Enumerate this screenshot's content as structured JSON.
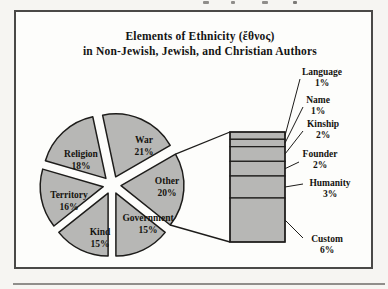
{
  "page": {
    "title_line1": "Elements of Ethnicity (ἔθνος)",
    "title_line2": "in Non-Jewish, Jewish, and Christian Authors"
  },
  "chart_data": {
    "type": "pie",
    "subtype": "bar-of-pie",
    "title": "Elements of Ethnicity (ἔθνος) in Non-Jewish, Jewish, and Christian Authors",
    "legend_position": "none",
    "slice_fill": "#b7b7b5",
    "line_color": "#1d1c1a",
    "pie": {
      "direction": "clockwise-from-top",
      "start_offset_deg": -12,
      "center": [
        112,
        185
      ],
      "radius": 63,
      "explode_px": 9,
      "slices": [
        {
          "label": "War",
          "value": 21,
          "label_xy": [
            144,
            143
          ]
        },
        {
          "label": "Other",
          "value": 20,
          "label_xy": [
            167,
            184
          ],
          "breakout": true
        },
        {
          "label": "Government",
          "value": 15,
          "label_xy": [
            148,
            221
          ]
        },
        {
          "label": "Kind",
          "value": 15,
          "label_xy": [
            100,
            235
          ]
        },
        {
          "label": "Territory",
          "value": 16,
          "label_xy": [
            69,
            198
          ]
        },
        {
          "label": "Religion",
          "value": 18,
          "label_xy": [
            81,
            157
          ]
        }
      ]
    },
    "breakout_bar": {
      "x": 230,
      "y": 132,
      "width": 55,
      "height": 110,
      "segments": [
        {
          "label": "Language",
          "value": 1,
          "label_xy": [
            322,
            75
          ],
          "leader_from": [
            300,
            79
          ]
        },
        {
          "label": "Name",
          "value": 1,
          "label_xy": [
            318,
            103
          ],
          "leader_from": [
            303,
            107
          ]
        },
        {
          "label": "Kinship",
          "value": 2,
          "label_xy": [
            323,
            127
          ],
          "leader_from": [
            303,
            131
          ]
        },
        {
          "label": "Founder",
          "value": 2,
          "label_xy": [
            320,
            157
          ],
          "leader_from": [
            299,
            162
          ]
        },
        {
          "label": "Humanity",
          "value": 3,
          "label_xy": [
            330,
            186
          ],
          "leader_from": [
            303,
            184
          ]
        },
        {
          "label": "Custom",
          "value": 6,
          "label_xy": [
            327,
            242
          ],
          "leader_from": [
            303,
            238
          ]
        }
      ]
    }
  }
}
